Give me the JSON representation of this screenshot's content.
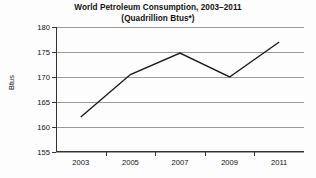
{
  "chart_data": {
    "type": "line",
    "title": "World Petroleum Consumption, 2003–2011",
    "subtitle": "(Quadrillion Btus*)",
    "xlabel": "",
    "ylabel": "Btus",
    "x": [
      2003,
      2005,
      2007,
      2009,
      2011
    ],
    "categories": [
      "2003",
      "2005",
      "2007",
      "2009",
      "2011"
    ],
    "values": [
      162.0,
      170.5,
      174.8,
      170.0,
      177.0
    ],
    "series": [
      {
        "name": "World Petroleum Consumption",
        "values": [
          162.0,
          170.5,
          174.8,
          170.0,
          177.0
        ]
      }
    ],
    "ylim": [
      155,
      180
    ],
    "ytick_labels": [
      "180",
      "175",
      "170",
      "165",
      "160",
      "155"
    ],
    "ytick_values": [
      180,
      175,
      170,
      165,
      160,
      155
    ],
    "xtick_labels": [
      "2003",
      "2005",
      "2007",
      "2009",
      "2011"
    ],
    "grid": true,
    "grid_axis": "y",
    "legend": false,
    "line_color": "#1a1a1a",
    "grid_color": "#9a9a9a",
    "axis_color": "#333333",
    "background_color": "#fdfdfd"
  }
}
